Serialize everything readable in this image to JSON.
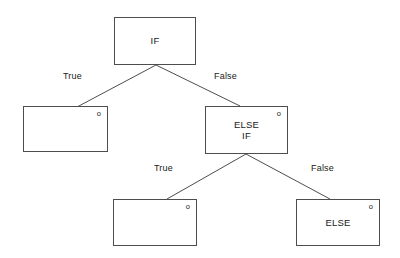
{
  "diagram": {
    "width": 400,
    "height": 258,
    "background_color": "#ffffff",
    "stroke_color": "#4d4d4d",
    "text_color": "#1a1a1a",
    "anchor_marker": "o",
    "nodes": [
      {
        "id": "if",
        "label": "IF",
        "x": 114,
        "y": 17,
        "width": 82,
        "height": 48,
        "has_anchor": false
      },
      {
        "id": "if-true-branch",
        "label": "",
        "x": 23,
        "y": 106,
        "width": 85,
        "height": 46,
        "has_anchor": true
      },
      {
        "id": "else-if",
        "label": "ELSE\nIF",
        "x": 205,
        "y": 106,
        "width": 83,
        "height": 48,
        "has_anchor": true
      },
      {
        "id": "else-if-true-branch",
        "label": "",
        "x": 113,
        "y": 199,
        "width": 84,
        "height": 47,
        "has_anchor": true
      },
      {
        "id": "else",
        "label": "ELSE",
        "x": 296,
        "y": 199,
        "width": 84,
        "height": 47,
        "has_anchor": true
      }
    ],
    "edges": [
      {
        "id": "if-to-true",
        "from": "if",
        "to": "if-true-branch",
        "label": "True",
        "x1": 156,
        "y1": 65,
        "x2": 77,
        "y2": 107
      },
      {
        "id": "if-to-false",
        "from": "if",
        "to": "else-if",
        "label": "False",
        "x1": 156,
        "y1": 65,
        "x2": 240,
        "y2": 106
      },
      {
        "id": "elseif-to-true",
        "from": "else-if",
        "to": "else-if-true-branch",
        "label": "True",
        "x1": 246,
        "y1": 154,
        "x2": 167,
        "y2": 199
      },
      {
        "id": "elseif-to-false",
        "from": "else-if",
        "to": "else",
        "label": "False",
        "x1": 246,
        "y1": 154,
        "x2": 330,
        "y2": 199
      }
    ],
    "edge_labels": [
      {
        "id": "label-if-true",
        "text": "True",
        "x": 63,
        "y": 71
      },
      {
        "id": "label-if-false",
        "text": "False",
        "x": 214,
        "y": 71
      },
      {
        "id": "label-elseif-true",
        "text": "True",
        "x": 154,
        "y": 163
      },
      {
        "id": "label-elseif-false",
        "text": "False",
        "x": 311,
        "y": 163
      }
    ]
  }
}
